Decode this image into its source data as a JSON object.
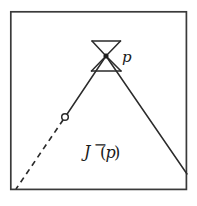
{
  "figure": {
    "type": "spacetime-causal-diagram",
    "background_color": "#ffffff",
    "stroke_color": "#2b2b2b",
    "text_color": "#1a1a1a",
    "frame": {
      "name": "outer-border",
      "x": 10,
      "y": 11,
      "width": 177,
      "height": 179,
      "stroke_width": 1.6,
      "fill": "none"
    },
    "labels": {
      "point_p": "p",
      "causal_past_J": "J",
      "causal_past_superscript": "−",
      "causal_past_paren_open": "(",
      "causal_past_arg": "p",
      "causal_past_paren_close": ")",
      "causal_past_full": "J−(p)"
    },
    "point_p": {
      "name": "point-p",
      "cx": 106,
      "cy": 56,
      "r": 2.2,
      "filled": true
    },
    "endpoint_circle": {
      "name": "past-endpoint-circle",
      "cx": 65,
      "cy": 117,
      "r": 3.4,
      "filled": false,
      "stroke_width": 1.5
    },
    "light_cone": {
      "name": "light-cone-at-p",
      "apex_x": 106,
      "apex_y": 56,
      "half_width": 14,
      "half_height": 15,
      "top_bar_y": 41,
      "bottom_bar_y": 71,
      "left_x": 92,
      "right_x": 120,
      "stroke_width": 1.5
    },
    "boundary_left": {
      "name": "left-null-boundary-solid",
      "x1": 106,
      "y1": 56,
      "x2": 65,
      "y2": 117,
      "style": "solid",
      "stroke_width": 1.5
    },
    "boundary_left_dashed": {
      "name": "left-null-boundary-dashed",
      "x1": 65,
      "y1": 117,
      "x2": 16,
      "y2": 189,
      "style": "dashed",
      "dash_pattern": "5 4",
      "stroke_width": 1.6
    },
    "boundary_right": {
      "name": "right-null-boundary-solid",
      "x1": 106,
      "y1": 56,
      "x2": 187,
      "y2": 174,
      "style": "solid",
      "stroke_width": 1.5
    },
    "label_positions": {
      "p_x": 122,
      "p_y": 62,
      "j_x": 84,
      "j_y": 157
    }
  }
}
